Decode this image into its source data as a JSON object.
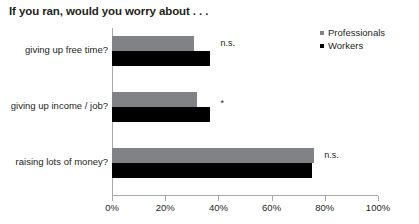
{
  "title": "If you ran, would you worry about . . .",
  "legend": {
    "position": "top-right",
    "items": [
      {
        "label": "Professionals",
        "color": "#808285",
        "swatch": "square-marker-icon"
      },
      {
        "label": "Workers",
        "color": "#000000",
        "swatch": "square-marker-icon"
      }
    ]
  },
  "axis": {
    "ticks": [
      "0%",
      "20%",
      "40%",
      "60%",
      "80%",
      "100%"
    ],
    "tick_values": [
      0,
      20,
      40,
      60,
      80,
      100
    ]
  },
  "annotations": {
    "group0": "n.s.",
    "group1": "*",
    "group2": "n.s."
  },
  "chart_data": {
    "type": "bar",
    "orientation": "horizontal",
    "title": "If you ran, would you worry about . . .",
    "xlabel": "",
    "ylabel": "",
    "xlim": [
      0,
      100
    ],
    "grid": false,
    "legend_position": "top-right",
    "categories": [
      "giving up free time?",
      "giving up income / job?",
      "raising lots of money?"
    ],
    "series": [
      {
        "name": "Professionals",
        "color": "#808285",
        "values": [
          31,
          32,
          76
        ]
      },
      {
        "name": "Workers",
        "color": "#000000",
        "values": [
          37,
          37,
          75
        ]
      }
    ],
    "annotations": [
      "n.s.",
      "*",
      "n.s."
    ],
    "tick_labels": [
      "0%",
      "20%",
      "40%",
      "60%",
      "80%",
      "100%"
    ]
  }
}
